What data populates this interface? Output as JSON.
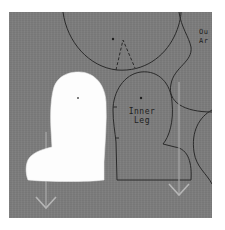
{
  "scene": {
    "description": "Sewing pattern pieces traced on gray fabric with a white paper cutout",
    "background_color": "#7c7c7c",
    "cutout_color": "#fdfdfd",
    "line_color": "#2a2a2a",
    "grainline_color": "#a9a9a9"
  },
  "labels": {
    "inner_leg_line1": "Inner",
    "inner_leg_line2": "Leg",
    "corner_line1": "Ou",
    "corner_line2": "Ar"
  }
}
